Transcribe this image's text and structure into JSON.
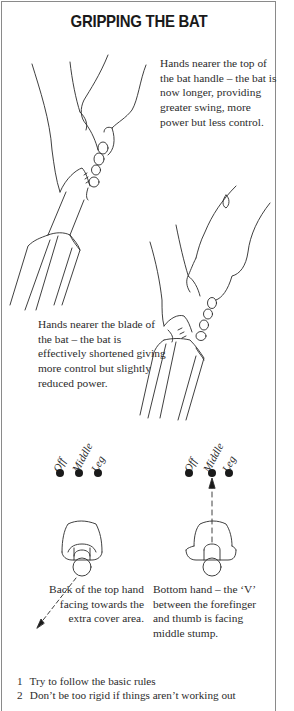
{
  "title": "GRIPPING THE BAT",
  "captions": {
    "top_grip": "Hands nearer the top of the bat handle – the bat is now longer, providing greater swing, more power but less control.",
    "blade_grip": "Hands nearer the blade of the bat – the bat is effectively shortened giving more control but slightly reduced power.",
    "back_of_hand": "Back of the top hand facing towards the extra cover area.",
    "bottom_hand": "Bottom hand – the ‘V’ between the forefinger and thumb is facing middle stump."
  },
  "stumps": {
    "left": {
      "labels": [
        "Off",
        "Middle",
        "Leg"
      ]
    },
    "right": {
      "labels": [
        "Off",
        "Middle",
        "Leg"
      ]
    }
  },
  "notes": [
    {
      "num": "1",
      "text": "Try to follow the basic rules"
    },
    {
      "num": "2",
      "text": "Don’t be too rigid if things aren’t working out"
    }
  ],
  "icons": {
    "arrow_left": "dashed-arrow-down-left",
    "arrow_right": "dashed-arrow-up"
  },
  "colors": {
    "line": "#2a2a2a",
    "border": "#8a8a8a"
  }
}
